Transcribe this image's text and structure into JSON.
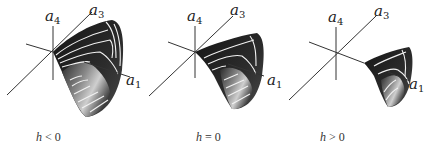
{
  "figure": {
    "panels": [
      {
        "id": "h-negative",
        "caption": {
          "var": "h",
          "relation": "< 0"
        },
        "axes": {
          "a1": "a",
          "a1_sub": "1",
          "a3": "a",
          "a3_sub": "3",
          "a4": "a",
          "a4_sub": "4"
        }
      },
      {
        "id": "h-zero",
        "caption": {
          "var": "h",
          "relation": "= 0"
        },
        "axes": {
          "a1": "a",
          "a1_sub": "1",
          "a3": "a",
          "a3_sub": "3",
          "a4": "a",
          "a4_sub": "4"
        }
      },
      {
        "id": "h-positive",
        "caption": {
          "var": "h",
          "relation": "> 0"
        },
        "axes": {
          "a1": "a",
          "a1_sub": "1",
          "a3": "a",
          "a3_sub": "3",
          "a4": "a",
          "a4_sub": "4"
        }
      }
    ],
    "colors": {
      "axis": "#333333",
      "surface_dark": "#1e1e1e",
      "surface_mid": "#555555",
      "surface_light": "#c8c8c8",
      "contour": "#f2f2f2"
    }
  }
}
